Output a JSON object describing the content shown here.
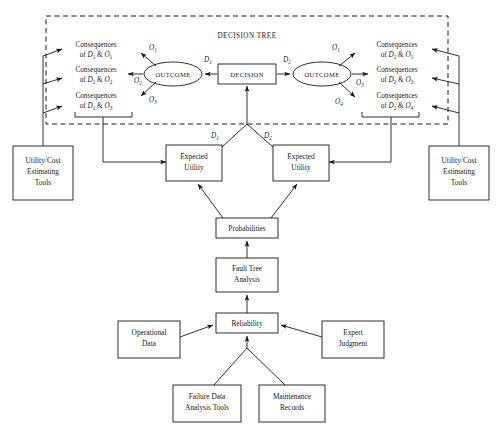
{
  "diagram": {
    "region_label": "DECISION TREE",
    "colors": {
      "stroke": "#1a1a1a",
      "fill": "#ffffff",
      "background": "#ffffff"
    },
    "decision_node": {
      "label": "DECISION",
      "shape": "rectangle"
    },
    "outcome_nodes": [
      {
        "label": "OUTCOME",
        "shape": "ellipse",
        "side": "left"
      },
      {
        "label": "OUTCOME",
        "shape": "ellipse",
        "side": "right"
      }
    ],
    "decision_branches": [
      {
        "label": "D",
        "subscript": "1",
        "side": "left"
      },
      {
        "label": "D",
        "subscript": "2",
        "side": "right"
      }
    ],
    "outcome_branches_left": [
      {
        "label": "O",
        "subscript": "1"
      },
      {
        "label": "O",
        "subscript": "2"
      },
      {
        "label": "O",
        "subscript": "3"
      }
    ],
    "outcome_branches_right": [
      {
        "label": "O",
        "subscript": "1"
      },
      {
        "label": "O",
        "subscript": "3"
      },
      {
        "label": "O",
        "subscript": "4"
      }
    ],
    "consequences_left": [
      {
        "line1": "Consequences",
        "prefix": "of ",
        "d": "D",
        "dsub": "1",
        "amp": " & ",
        "o": "O",
        "osub": "1"
      },
      {
        "line1": "Consequences",
        "prefix": "of ",
        "d": "D",
        "dsub": "1",
        "amp": " & ",
        "o": "O",
        "osub": "2"
      },
      {
        "line1": "Consequences",
        "prefix": "of ",
        "d": "D",
        "dsub": "1",
        "amp": " & ",
        "o": "O",
        "osub": "3"
      }
    ],
    "consequences_right": [
      {
        "line1": "Consequences",
        "prefix": "of ",
        "d": "D",
        "dsub": "2",
        "amp": " & ",
        "o": "O",
        "osub": "1"
      },
      {
        "line1": "Consequences",
        "prefix": "of ",
        "d": "D",
        "dsub": "2",
        "amp": " & ",
        "o": "O",
        "osub": "3"
      },
      {
        "line1": "Consequences",
        "prefix": "of ",
        "d": "D",
        "dsub": "2",
        "amp": " & ",
        "o": "O",
        "osub": "4"
      }
    ],
    "tool_boxes": [
      {
        "line1": "Utility/Cost",
        "line2": "Estimating",
        "line3": "Tools",
        "side": "left"
      },
      {
        "line1": "Utility/Cost",
        "line2": "Estimating",
        "line3": "Tools",
        "side": "right"
      }
    ],
    "expected_utility_boxes": [
      {
        "line1": "Expected",
        "line2": "Utility",
        "side": "left"
      },
      {
        "line1": "Expected",
        "line2": "Utility",
        "side": "right"
      }
    ],
    "probabilities_box": {
      "label": "Probabilities"
    },
    "fault_tree_box": {
      "line1": "Fault Tree",
      "line2": "Analysis"
    },
    "reliability_box": {
      "label": "Reliability"
    },
    "operational_data_box": {
      "line1": "Operational",
      "line2": "Data"
    },
    "expert_judgment_box": {
      "line1": "Expert",
      "line2": "Judgment"
    },
    "failure_data_box": {
      "line1": "Failure Data",
      "line2": "Analysis Tools"
    },
    "maintenance_records_box": {
      "line1": "Maintenance",
      "line2": "Records"
    }
  }
}
